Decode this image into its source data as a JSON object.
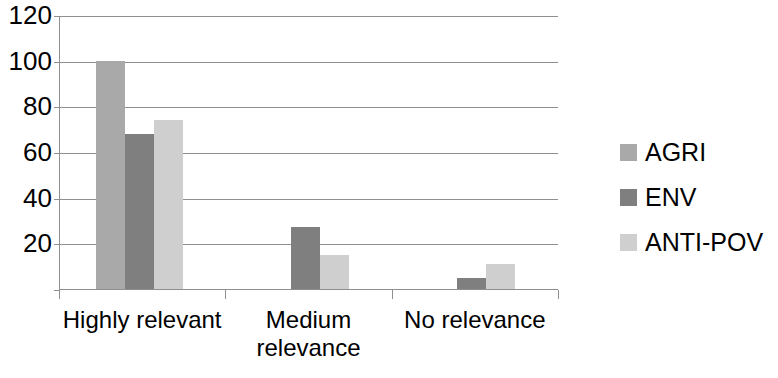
{
  "chart_data": {
    "type": "bar",
    "title": "",
    "subtitle": "",
    "xlabel": "",
    "ylabel": "",
    "categories": [
      "Highly relevant",
      "Medium relevance",
      "No relevance"
    ],
    "category_lines": [
      [
        "Highly relevant"
      ],
      [
        "Medium",
        "relevance"
      ],
      [
        "No relevance"
      ]
    ],
    "series": [
      {
        "name": "AGRI",
        "color": "#a9a9a9",
        "values": [
          100,
          0,
          0
        ]
      },
      {
        "name": "ENV",
        "color": "#7f7f7f",
        "values": [
          68,
          27,
          5
        ]
      },
      {
        "name": "ANTI-POV",
        "color": "#cfcfcf",
        "values": [
          74,
          15,
          11
        ]
      }
    ],
    "ylim": [
      0,
      120
    ],
    "yticks": [
      120,
      100,
      80,
      60,
      40,
      20
    ],
    "ytick_labels": [
      "120",
      "100",
      "80",
      "60",
      "40",
      "20"
    ],
    "grid": true,
    "grid_axis": "y",
    "legend_position": "right",
    "axis_color": "#8f8f8f",
    "background": "#ffffff"
  },
  "legend": {
    "items": [
      {
        "label": "AGRI",
        "color": "#a9a9a9"
      },
      {
        "label": "ENV",
        "color": "#7f7f7f"
      },
      {
        "label": "ANTI-POV",
        "color": "#cfcfcf"
      }
    ]
  },
  "y_axis": {
    "ticks": [
      {
        "label": "120",
        "value": 120
      },
      {
        "label": "100",
        "value": 100
      },
      {
        "label": "80",
        "value": 80
      },
      {
        "label": "60",
        "value": 60
      },
      {
        "label": "40",
        "value": 40
      },
      {
        "label": "20",
        "value": 20
      }
    ]
  },
  "x_axis": {
    "categories": [
      {
        "label": "Highly relevant"
      },
      {
        "label": "Medium\nrelevance"
      },
      {
        "label": "No relevance"
      }
    ]
  }
}
